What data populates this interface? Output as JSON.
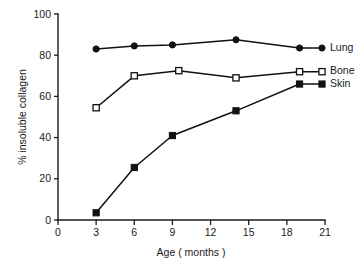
{
  "chart_data": {
    "type": "line",
    "title": "",
    "xlabel": "Age ( months )",
    "ylabel": "% insoluble collagen",
    "xlim": [
      0,
      21
    ],
    "ylim": [
      0,
      100
    ],
    "xticks": [
      0,
      3,
      6,
      9,
      12,
      15,
      18,
      21
    ],
    "xtick_labels": [
      "0",
      "3",
      "6",
      "9",
      "12",
      "15",
      "18",
      "21"
    ],
    "yticks": [
      0,
      20,
      40,
      60,
      80,
      100
    ],
    "ytick_labels": [
      "0",
      "20",
      "40",
      "60",
      "80",
      "100"
    ],
    "grid": false,
    "legend_position": "right-inline",
    "series": [
      {
        "name": "Lung",
        "marker": "filled-circle",
        "color": "#111111",
        "x": [
          3,
          6,
          9,
          14,
          19
        ],
        "values": [
          83,
          84.5,
          85,
          87.5,
          83.5
        ]
      },
      {
        "name": "Bone",
        "marker": "open-square",
        "color": "#111111",
        "x": [
          3,
          6,
          9.5,
          14,
          19
        ],
        "values": [
          54.5,
          70,
          72.5,
          69,
          72
        ]
      },
      {
        "name": "Skin",
        "marker": "filled-square",
        "color": "#111111",
        "x": [
          3,
          6,
          9,
          14,
          19
        ],
        "values": [
          3.5,
          25.5,
          41,
          53,
          66
        ]
      }
    ]
  },
  "axes": {
    "x_title": "Age ( months )",
    "y_title": "% insoluble collagen"
  }
}
